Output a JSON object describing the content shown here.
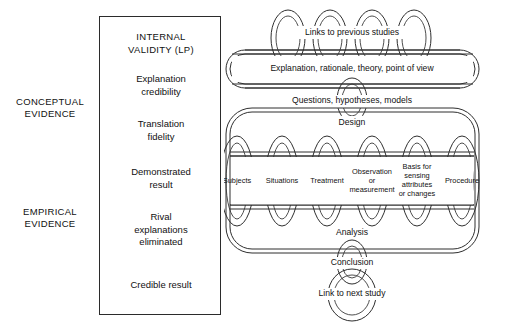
{
  "diagram": {
    "left_column": {
      "labels": [
        {
          "id": "conceptual",
          "text": "CONCEPTUAL\nEVIDENCE"
        },
        {
          "id": "empirical",
          "text": "EMPIRICAL\nEVIDENCE"
        }
      ]
    },
    "validity_box": {
      "title": "INTERNAL\nVALIDITY (LP)",
      "items": [
        "Explanation\ncredibility",
        "Translation\nfidelity",
        "Demonstrated\nresult",
        "Rival\nexplanations\neliminated",
        "Credible result"
      ]
    },
    "chain": {
      "top_link": "Links to previous studies",
      "band_conceptual": "Explanation, rationale, theory, point of view",
      "connector_upper": "Questions, hypotheses, models",
      "band_design": "Design",
      "elements": [
        "Subjects",
        "Situations",
        "Treatment",
        "Observation\nor\nmeasurement",
        "Basis for\nsensing\nattributes\nor changes",
        "Procedure"
      ],
      "band_analysis": "Analysis",
      "connector_lower": "Conclusion",
      "bottom_link": "Link to next study"
    },
    "colors": {
      "stroke": "#2e2e2e",
      "background": "#ffffff",
      "text": "#111111"
    }
  }
}
